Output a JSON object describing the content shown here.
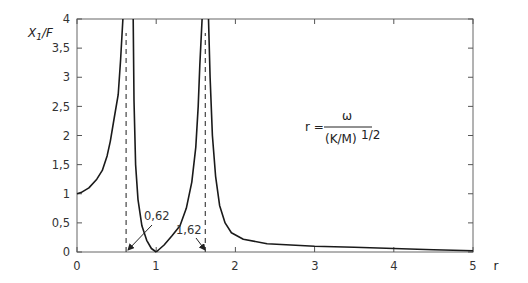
{
  "chart_data": {
    "type": "line",
    "title": "",
    "xlabel": "r",
    "ylabel": "X1/F",
    "ylabel_main": "X",
    "ylabel_sub": "1",
    "ylabel_tail": "/F",
    "xlim": [
      0,
      5
    ],
    "ylim": [
      0,
      4
    ],
    "grid": false,
    "x_ticks": [
      "0",
      "1",
      "2",
      "3",
      "4",
      "5"
    ],
    "y_ticks": [
      "0",
      "0,5",
      "1",
      "1,5",
      "2",
      "2,5",
      "3",
      "3,5",
      "4"
    ],
    "series": [
      {
        "name": "X1/F",
        "segments": [
          {
            "x": [
              0.0,
              0.05,
              0.15,
              0.25,
              0.32,
              0.38,
              0.42,
              0.47,
              0.52,
              0.55,
              0.58
            ],
            "y": [
              1.0,
              1.02,
              1.1,
              1.25,
              1.4,
              1.65,
              1.9,
              2.3,
              2.7,
              3.3,
              4.0
            ]
          },
          {
            "x": [
              0.71,
              0.72,
              0.74,
              0.77,
              0.82,
              0.88,
              0.94,
              1.0
            ],
            "y": [
              4.0,
              2.6,
              1.5,
              0.9,
              0.45,
              0.2,
              0.06,
              0.0
            ]
          },
          {
            "x": [
              1.0,
              1.1,
              1.2,
              1.3,
              1.38,
              1.45,
              1.5,
              1.53,
              1.55,
              1.58
            ],
            "y": [
              0.0,
              0.12,
              0.28,
              0.45,
              0.75,
              1.2,
              1.8,
              2.5,
              3.2,
              4.0
            ]
          },
          {
            "x": [
              1.66,
              1.68,
              1.71,
              1.75,
              1.8,
              1.87,
              1.95,
              2.1,
              2.4,
              3.0,
              3.5,
              4.0,
              4.5,
              5.0
            ],
            "y": [
              4.0,
              3.0,
              2.0,
              1.3,
              0.8,
              0.5,
              0.33,
              0.22,
              0.14,
              0.1,
              0.08,
              0.06,
              0.04,
              0.02
            ]
          }
        ]
      }
    ],
    "reference_lines": [
      {
        "type": "vertical",
        "x": 0.62,
        "style": "dashed",
        "label": "0,62"
      },
      {
        "type": "vertical",
        "x": 1.62,
        "style": "dashed",
        "label": "1,62"
      }
    ],
    "annotations": [
      {
        "text": "0,62",
        "points_to": [
          0.62,
          0
        ]
      },
      {
        "text": "1,62",
        "points_to": [
          1.62,
          0
        ]
      }
    ],
    "formula": {
      "lhs": "r =",
      "numerator": "ω",
      "denominator": "(K/M)",
      "exponent": "1/2"
    }
  }
}
